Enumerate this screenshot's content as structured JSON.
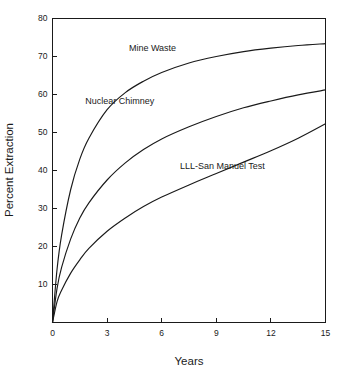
{
  "chart_data": {
    "type": "line",
    "title": "",
    "xlabel": "Years",
    "ylabel": "Percent Extraction",
    "xlim": [
      0,
      15
    ],
    "ylim": [
      0,
      80
    ],
    "grid": false,
    "legend_position": "inline-annotations",
    "xticks": [
      "0",
      "3",
      "6",
      "9",
      "12",
      "15"
    ],
    "xtick_values": [
      0,
      3,
      6,
      9,
      12,
      15
    ],
    "yticks": [
      "10",
      "20",
      "30",
      "40",
      "50",
      "60",
      "70",
      "80"
    ],
    "ytick_values": [
      10,
      20,
      30,
      40,
      50,
      60,
      70,
      80
    ],
    "x": [
      0,
      0.25,
      0.5,
      1,
      1.5,
      2,
      3,
      4,
      5,
      6,
      7.5,
      9,
      10.5,
      12,
      13.5,
      15
    ],
    "series": [
      {
        "name": "Mine Waste",
        "label": "Mine Waste",
        "color": "#1a1a1a",
        "values": [
          0,
          14,
          23,
          35,
          43,
          48.5,
          56,
          60.5,
          63.5,
          65.8,
          68.3,
          70.0,
          71.3,
          72.2,
          72.9,
          73.4
        ],
        "label_x": 4.2,
        "label_y": 71.5
      },
      {
        "name": "Nuclear Chimney",
        "label": "Nuclear Chimney",
        "color": "#1a1a1a",
        "values": [
          0,
          9,
          14.5,
          22,
          27.5,
          31.5,
          37.5,
          42,
          45.5,
          48.3,
          51.5,
          54.2,
          56.5,
          58.3,
          59.9,
          61.2
        ],
        "label_x": 1.8,
        "label_y": 57.5
      },
      {
        "name": "LLL-San Manuel Test",
        "label": "LLL-San Manuel Test",
        "color": "#1a1a1a",
        "values": [
          0,
          5.5,
          8.5,
          13,
          16.5,
          19.5,
          24,
          27.5,
          30.5,
          33,
          36.2,
          39.2,
          42.2,
          45.2,
          48.5,
          52.3
        ],
        "label_x": 7.0,
        "label_y": 40.5
      }
    ]
  }
}
